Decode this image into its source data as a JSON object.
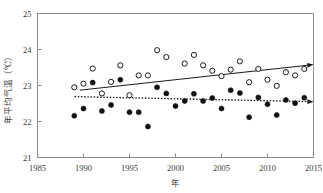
{
  "chart_data": {
    "type": "scatter",
    "title": "",
    "xlabel": "年",
    "ylabel": "年平均气温（℃）",
    "xlim": [
      1985,
      2015
    ],
    "ylim": [
      21,
      25
    ],
    "xticks": [
      1985,
      1990,
      1995,
      2000,
      2005,
      2010,
      2015
    ],
    "yticks": [
      21,
      22,
      23,
      24,
      25
    ],
    "grid": false,
    "legend_position": "none",
    "series": [
      {
        "name": "open-circles",
        "marker": "open-circle",
        "color": "#1a1a1a",
        "x": [
          1989,
          1990,
          1991,
          1992,
          1993,
          1994,
          1995,
          1996,
          1997,
          1998,
          1999,
          2001,
          2002,
          2003,
          2004,
          2005,
          2006,
          2007,
          2008,
          2009,
          2010,
          2011,
          2012,
          2013,
          2014
        ],
        "values": [
          22.95,
          23.05,
          23.47,
          22.78,
          23.1,
          23.56,
          22.73,
          23.28,
          23.28,
          23.98,
          23.79,
          23.61,
          23.85,
          23.56,
          23.41,
          23.26,
          23.44,
          23.67,
          23.09,
          23.46,
          23.16,
          22.99,
          23.37,
          23.28,
          23.46
        ],
        "trend": {
          "style": "solid",
          "arrow": true,
          "x_start": 1989.6,
          "y_start": 22.87,
          "x_end": 2015.0,
          "y_end": 23.58
        }
      },
      {
        "name": "solid-circles",
        "marker": "solid-circle",
        "color": "#111111",
        "x": [
          1989,
          1990,
          1991,
          1992,
          1993,
          1994,
          1995,
          1996,
          1997,
          1998,
          1999,
          2000,
          2001,
          2002,
          2003,
          2004,
          2005,
          2006,
          2007,
          2008,
          2009,
          2010,
          2011,
          2012,
          2013,
          2014
        ],
        "values": [
          22.16,
          22.36,
          23.08,
          22.29,
          22.46,
          23.16,
          22.26,
          22.26,
          21.86,
          22.95,
          22.78,
          22.43,
          22.57,
          22.77,
          22.57,
          22.65,
          22.36,
          22.87,
          22.79,
          22.12,
          22.67,
          22.48,
          22.18,
          22.6,
          22.51,
          22.66
        ],
        "trend": {
          "style": "dotted",
          "arrow": true,
          "x_start": 1989.1,
          "y_start": 22.69,
          "x_end": 2015.0,
          "y_end": 22.55
        }
      }
    ]
  }
}
